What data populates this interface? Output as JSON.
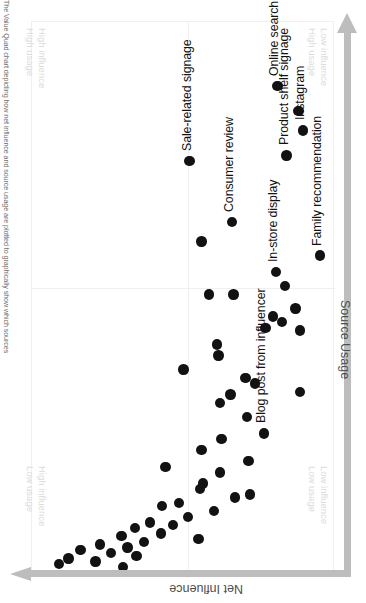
{
  "caption": "The Value Quad chart depicting how net influence and source usage are plotted to graphically show which sources",
  "axes": {
    "x_title": "Net Influence",
    "y_title": "Source Usage"
  },
  "quadrants": [
    {
      "name": "high-influence-high-usage",
      "line1": "High influence",
      "line2": "High usage"
    },
    {
      "name": "high-influence-low-usage",
      "line1": "High influence",
      "line2": "Low usage"
    },
    {
      "name": "low-influence-high-usage",
      "line1": "Low influence",
      "line2": "High usage"
    },
    {
      "name": "low-influence-low-usage",
      "line1": "Low influence",
      "line2": "Low usage"
    }
  ],
  "colors": {
    "dot": "#121212",
    "axis_arrow": "#bdbdbd",
    "quadrant_text": "#dcdcdc",
    "divider": "#efefef",
    "background": "#ffffff"
  },
  "chart_data": {
    "type": "scatter",
    "title": "",
    "xlabel": "Net Influence",
    "ylabel": "Source Usage",
    "grid": true,
    "legend": "none",
    "xlim": [
      0,
      100
    ],
    "ylim": [
      0,
      100
    ],
    "quadrant_split": {
      "x": 51.5,
      "y": 52.2
    },
    "labeled_points": [
      {
        "label": "Online search",
        "x": 88.5,
        "y": 81.0
      },
      {
        "label": "Sale-related signage",
        "x": 75.0,
        "y": 52.0
      },
      {
        "label": "Instagram",
        "x": 80.5,
        "y": 89.5
      },
      {
        "label": "Product shelf signage",
        "x": 76.0,
        "y": 84.0
      },
      {
        "label": "Family recommendation",
        "x": 58.0,
        "y": 95.0
      },
      {
        "label": "In-store display",
        "x": 55.0,
        "y": 80.5
      },
      {
        "label": "Consumer review",
        "x": 64.0,
        "y": 66.0
      },
      {
        "label": "Blog post from influencer",
        "x": 26.0,
        "y": 76.5
      }
    ],
    "points": [
      {
        "x": 88.5,
        "y": 81.0
      },
      {
        "x": 84.0,
        "y": 88.0
      },
      {
        "x": 80.5,
        "y": 89.5
      },
      {
        "x": 75.0,
        "y": 52.0
      },
      {
        "x": 76.0,
        "y": 84.0
      },
      {
        "x": 64.0,
        "y": 66.0
      },
      {
        "x": 60.5,
        "y": 56.0
      },
      {
        "x": 58.0,
        "y": 95.0
      },
      {
        "x": 55.0,
        "y": 80.5
      },
      {
        "x": 52.5,
        "y": 83.5
      },
      {
        "x": 51.0,
        "y": 66.5
      },
      {
        "x": 51.0,
        "y": 58.5
      },
      {
        "x": 48.5,
        "y": 87.0
      },
      {
        "x": 47.0,
        "y": 79.5
      },
      {
        "x": 46.0,
        "y": 82.5
      },
      {
        "x": 45.0,
        "y": 77.0
      },
      {
        "x": 44.5,
        "y": 88.5
      },
      {
        "x": 42.0,
        "y": 61.0
      },
      {
        "x": 40.0,
        "y": 61.5
      },
      {
        "x": 37.5,
        "y": 50.0
      },
      {
        "x": 36.0,
        "y": 70.5
      },
      {
        "x": 35.0,
        "y": 73.5
      },
      {
        "x": 33.5,
        "y": 88.5
      },
      {
        "x": 33.0,
        "y": 65.5
      },
      {
        "x": 31.5,
        "y": 62.0
      },
      {
        "x": 29.0,
        "y": 71.0
      },
      {
        "x": 26.0,
        "y": 76.5
      },
      {
        "x": 25.0,
        "y": 62.5
      },
      {
        "x": 23.0,
        "y": 56.0
      },
      {
        "x": 21.0,
        "y": 71.5
      },
      {
        "x": 20.0,
        "y": 44.0
      },
      {
        "x": 19.0,
        "y": 62.0
      },
      {
        "x": 17.0,
        "y": 56.5
      },
      {
        "x": 16.0,
        "y": 55.5
      },
      {
        "x": 15.0,
        "y": 72.0
      },
      {
        "x": 14.5,
        "y": 67.0
      },
      {
        "x": 13.5,
        "y": 48.5
      },
      {
        "x": 13.0,
        "y": 43.0
      },
      {
        "x": 12.0,
        "y": 60.0
      },
      {
        "x": 11.0,
        "y": 51.5
      },
      {
        "x": 10.0,
        "y": 39.0
      },
      {
        "x": 9.5,
        "y": 46.5
      },
      {
        "x": 9.0,
        "y": 34.0
      },
      {
        "x": 8.0,
        "y": 42.5
      },
      {
        "x": 7.5,
        "y": 29.5
      },
      {
        "x": 7.0,
        "y": 55.0
      },
      {
        "x": 6.5,
        "y": 37.0
      },
      {
        "x": 6.0,
        "y": 22.5
      },
      {
        "x": 5.5,
        "y": 31.5
      },
      {
        "x": 5.0,
        "y": 16.0
      },
      {
        "x": 4.5,
        "y": 26.0
      },
      {
        "x": 4.0,
        "y": 34.5
      },
      {
        "x": 3.5,
        "y": 12.0
      },
      {
        "x": 3.0,
        "y": 21.0
      },
      {
        "x": 2.5,
        "y": 9.0
      },
      {
        "x": 2.0,
        "y": 30.0
      }
    ]
  }
}
